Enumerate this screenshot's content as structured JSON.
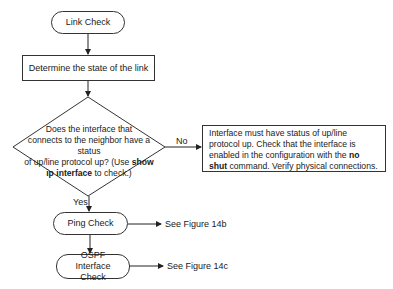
{
  "flowchart": {
    "start": {
      "label": "Link Check"
    },
    "step1": {
      "label": "Determine the state of the link"
    },
    "decision": {
      "line1": "Does the interface that",
      "line2": "connects to the neighbor have a status",
      "line3_pre": "of up/line protocol up? (Use ",
      "line3_bold": "show",
      "line4_bold": "ip interface",
      "line4_post": " to check.)"
    },
    "no_branch": {
      "label": "No",
      "text_pre": "Interface must have status of up/line protocol up. Check that the interface is enabled in the configuration with the ",
      "text_bold": "no shut",
      "text_post": " command. Verify physical connections."
    },
    "yes_branch": {
      "label": "Yes"
    },
    "ping": {
      "label": "Ping Check",
      "ref": "See Figure 14b"
    },
    "ospf": {
      "label": "OSPF Interface Check",
      "ref": "See Figure 14c"
    }
  }
}
